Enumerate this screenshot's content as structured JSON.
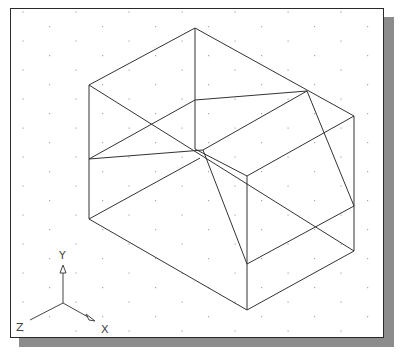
{
  "viewport": {
    "background": "#ffffff",
    "border_color": "#2a2a2a",
    "shadow_color": "#8c8c8c",
    "grid": {
      "type": "isometric-dots",
      "dx": 53,
      "dy": 14.5,
      "origin": [
        23,
        12
      ],
      "color": "#a8a8a8"
    }
  },
  "drawing": {
    "type": "isometric-wireframe-block",
    "edges": [
      [
        [
          195,
          28
        ],
        [
          89,
          85
        ]
      ],
      [
        [
          195,
          28
        ],
        [
          354,
          116
        ]
      ],
      [
        [
          195,
          28
        ],
        [
          195,
          149
        ]
      ],
      [
        [
          89,
          85
        ],
        [
          89,
          219
        ]
      ],
      [
        [
          89,
          85
        ],
        [
          354,
          251
        ]
      ],
      [
        [
          89,
          159
        ],
        [
          195,
          100
        ]
      ],
      [
        [
          195,
          100
        ],
        [
          307,
          91
        ]
      ],
      [
        [
          89,
          159
        ],
        [
          203,
          150
        ]
      ],
      [
        [
          203,
          150
        ],
        [
          307,
          91
        ]
      ],
      [
        [
          307,
          91
        ],
        [
          354,
          206
        ]
      ],
      [
        [
          203,
          150
        ],
        [
          247,
          264
        ]
      ],
      [
        [
          195,
          149
        ],
        [
          247,
          176
        ]
      ],
      [
        [
          247,
          176
        ],
        [
          354,
          116
        ]
      ],
      [
        [
          89,
          219
        ],
        [
          200,
          158
        ]
      ],
      [
        [
          89,
          219
        ],
        [
          247,
          310
        ]
      ],
      [
        [
          247,
          310
        ],
        [
          354,
          251
        ]
      ],
      [
        [
          247,
          176
        ],
        [
          247,
          310
        ]
      ],
      [
        [
          354,
          116
        ],
        [
          354,
          251
        ]
      ],
      [
        [
          247,
          264
        ],
        [
          354,
          206
        ]
      ]
    ]
  },
  "ucs_icon": {
    "origin": [
      63,
      303
    ],
    "y_axis_end": [
      63,
      265
    ],
    "x_axis_end": [
      95,
      321
    ],
    "z_axis_end": [
      30,
      320
    ],
    "labels": {
      "x": "X",
      "y": "Y",
      "z": "Z"
    }
  }
}
